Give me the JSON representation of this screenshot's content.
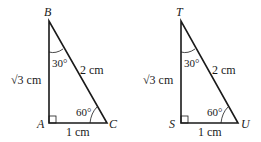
{
  "diagram": {
    "triangles": [
      {
        "name": "ABC",
        "vertices": {
          "top": "B",
          "right_angle": "A",
          "bottom_right": "C"
        },
        "sides": {
          "vertical_radicand": "3",
          "vertical_unit": "cm",
          "hypotenuse": "2 cm",
          "base": "1 cm"
        },
        "angles": {
          "top": "30°",
          "bottom_right": "60°"
        }
      },
      {
        "name": "TSU",
        "vertices": {
          "top": "T",
          "right_angle": "S",
          "bottom_right": "U"
        },
        "sides": {
          "vertical_radicand": "3",
          "vertical_unit": "cm",
          "hypotenuse": "2 cm",
          "base": "1 cm"
        },
        "angles": {
          "top": "30°",
          "bottom_right": "60°"
        }
      }
    ],
    "radical_symbol": "√",
    "line_color": "#1a1a1a"
  }
}
